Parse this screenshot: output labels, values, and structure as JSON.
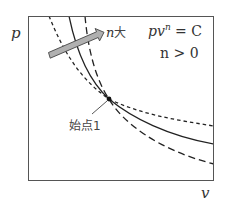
{
  "diagram": {
    "type": "p-v polytropic process diagram",
    "axes": {
      "y_label": "p",
      "x_label": "v"
    },
    "equation": {
      "line1_base": "pv",
      "line1_exp": "n",
      "line1_rhs": " = C",
      "line2": "n > 0"
    },
    "arrow": {
      "label_var": "n",
      "label_suffix": "大",
      "meaning": "direction of increasing n"
    },
    "start_point": {
      "label": "始点1"
    },
    "curves": [
      {
        "name": "smaller-n",
        "style": "short-dash"
      },
      {
        "name": "reference-n",
        "style": "solid"
      },
      {
        "name": "larger-n",
        "style": "long-dash"
      }
    ],
    "colors": {
      "frame": "#555555",
      "curve": "#222222",
      "arrow_fill": "#b0b0b0",
      "arrow_stroke": "#444444",
      "text": "#333333"
    }
  }
}
